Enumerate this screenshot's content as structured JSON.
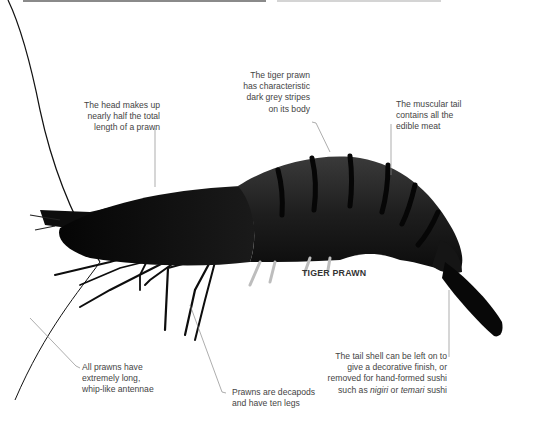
{
  "figure": {
    "title": "TIGER PRAWN",
    "colors": {
      "background": "#ffffff",
      "text": "#444444",
      "leader_line": "#8a8a8a",
      "prawn_body": "#1c1c1c",
      "prawn_stripe": "#0a0a0a",
      "top_bar_left": "#8a8a8a",
      "top_bar_right": "#d4d4d4"
    }
  },
  "annotations": {
    "head": {
      "lines": [
        "The head makes up",
        "nearly half the total",
        "length of a prawn"
      ]
    },
    "stripes": {
      "lines": [
        "The tiger prawn",
        "has characteristic",
        "dark grey stripes",
        "on its body"
      ]
    },
    "tail_meat": {
      "lines": [
        "The muscular tail",
        "contains all the",
        "edible meat"
      ]
    },
    "tail_shell": {
      "line1": "The tail shell can be left on to",
      "line2": "give a decorative finish, or",
      "line3": "removed for hand-formed sushi",
      "line4_prefix": "such as ",
      "line4_term1": "nigiri",
      "line4_mid": " or ",
      "line4_term2": "temari",
      "line4_suffix": " sushi"
    },
    "antennae": {
      "lines": [
        "All prawns have",
        "extremely long,",
        "whip-like antennae"
      ]
    },
    "legs": {
      "lines": [
        "Prawns are decapods",
        "and have ten legs"
      ]
    }
  }
}
